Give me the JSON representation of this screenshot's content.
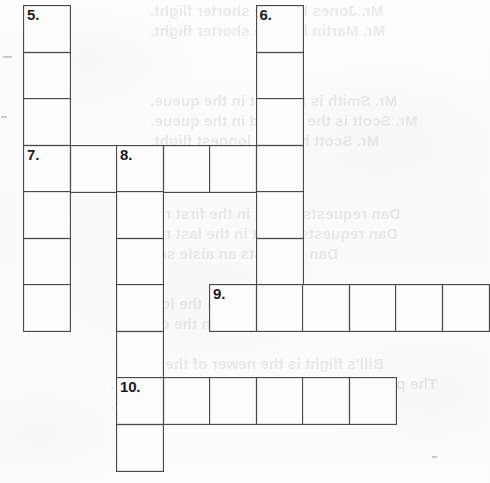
{
  "document": {
    "type": "crossword-puzzle-worksheet",
    "title": "Crossword Puzzle Grid",
    "cell_size": 46.5,
    "ink_color": "#4a4a4a",
    "paper_color": "#fcfcfc",
    "number_color": "#1b1b1b"
  },
  "grid": {
    "columns_x": [
      23,
      69.5,
      116,
      162.5,
      209,
      255.5,
      302,
      348.5,
      395,
      441.5
    ],
    "rows_y": [
      5,
      51.5,
      98,
      144.5,
      191,
      237.5,
      284,
      330.5,
      377,
      423.5
    ],
    "entries": [
      {
        "number": "5.",
        "direction": "down",
        "col": 0,
        "row": 0,
        "length": 4
      },
      {
        "number": "6.",
        "direction": "down",
        "col": 5,
        "row": 0,
        "length": 6
      },
      {
        "number": "7.",
        "direction": "across",
        "col": 0,
        "row": 3,
        "length": 6
      },
      {
        "number": "7b",
        "direction": "down",
        "col": 0,
        "row": 3,
        "length": 4
      },
      {
        "number": "8.",
        "direction": "down",
        "col": 2,
        "row": 3,
        "length": 7
      },
      {
        "number": "9.",
        "direction": "across",
        "col": 4,
        "row": 6,
        "length": 6
      },
      {
        "number": "10.",
        "direction": "across",
        "col": 2,
        "row": 8,
        "length": 6
      }
    ],
    "numbered_cells": [
      {
        "label": "5.",
        "col": 0,
        "row": 0
      },
      {
        "label": "6.",
        "col": 5,
        "row": 0
      },
      {
        "label": "7.",
        "col": 0,
        "row": 3
      },
      {
        "label": "8.",
        "col": 2,
        "row": 3
      },
      {
        "label": "9.",
        "col": 4,
        "row": 6
      },
      {
        "label": "10.",
        "col": 2,
        "row": 8
      }
    ],
    "cells": [
      {
        "col": 0,
        "row": 0,
        "label": "5."
      },
      {
        "col": 0,
        "row": 1,
        "label": ""
      },
      {
        "col": 0,
        "row": 2,
        "label": ""
      },
      {
        "col": 5,
        "row": 0,
        "label": "6."
      },
      {
        "col": 5,
        "row": 1,
        "label": ""
      },
      {
        "col": 5,
        "row": 2,
        "label": ""
      },
      {
        "col": 0,
        "row": 3,
        "label": "7."
      },
      {
        "col": 1,
        "row": 3,
        "label": ""
      },
      {
        "col": 2,
        "row": 3,
        "label": "8."
      },
      {
        "col": 3,
        "row": 3,
        "label": ""
      },
      {
        "col": 4,
        "row": 3,
        "label": ""
      },
      {
        "col": 5,
        "row": 3,
        "label": ""
      },
      {
        "col": 0,
        "row": 4,
        "label": ""
      },
      {
        "col": 2,
        "row": 4,
        "label": ""
      },
      {
        "col": 5,
        "row": 4,
        "label": ""
      },
      {
        "col": 0,
        "row": 5,
        "label": ""
      },
      {
        "col": 2,
        "row": 5,
        "label": ""
      },
      {
        "col": 5,
        "row": 5,
        "label": ""
      },
      {
        "col": 0,
        "row": 6,
        "label": ""
      },
      {
        "col": 2,
        "row": 6,
        "label": ""
      },
      {
        "col": 4,
        "row": 6,
        "label": "9."
      },
      {
        "col": 5,
        "row": 6,
        "label": ""
      },
      {
        "col": 6,
        "row": 6,
        "label": ""
      },
      {
        "col": 7,
        "row": 6,
        "label": ""
      },
      {
        "col": 8,
        "row": 6,
        "label": ""
      },
      {
        "col": 9,
        "row": 6,
        "label": ""
      },
      {
        "col": 2,
        "row": 7,
        "label": ""
      },
      {
        "col": 2,
        "row": 8,
        "label": "10."
      },
      {
        "col": 3,
        "row": 8,
        "label": ""
      },
      {
        "col": 4,
        "row": 8,
        "label": ""
      },
      {
        "col": 5,
        "row": 8,
        "label": ""
      },
      {
        "col": 6,
        "row": 8,
        "label": ""
      },
      {
        "col": 7,
        "row": 8,
        "label": ""
      },
      {
        "col": 2,
        "row": 9,
        "label": ""
      }
    ]
  },
  "bleed_through_text": {
    "note": "faint mirrored text showing through from the reverse side of the sheet",
    "lines": [
      {
        "text": "Mr. Jones has the shorter flight.",
        "x": 150,
        "y": 2,
        "size": 15
      },
      {
        "text": "Mr. Martin has the shorter flight.",
        "x": 150,
        "y": 22,
        "size": 15
      },
      {
        "text": "Mr. Smith is the first in the queue.",
        "x": 150,
        "y": 92,
        "size": 15
      },
      {
        "text": "Mr. Scott is the second in the queue.",
        "x": 150,
        "y": 112,
        "size": 15
      },
      {
        "text": "Mr. Scott has the longest flight.",
        "x": 150,
        "y": 132,
        "size": 15
      },
      {
        "text": "Dan requests a seat in the first row.",
        "x": 140,
        "y": 205,
        "size": 15
      },
      {
        "text": "Dan requests a seat in the last row.",
        "x": 140,
        "y": 225,
        "size": 15
      },
      {
        "text": "Dan requests an aisle seat.",
        "x": 140,
        "y": 245,
        "size": 15
      },
      {
        "text": "The passengers have to wait in the lounge.",
        "x": 120,
        "y": 295,
        "size": 15
      },
      {
        "text": "The passengers have to wait in the queue.",
        "x": 120,
        "y": 315,
        "size": 15
      },
      {
        "text": "Bill's flight is the newer of the two.",
        "x": 130,
        "y": 355,
        "size": 15
      },
      {
        "text": "The passengers have to check in at the gate.",
        "x": 110,
        "y": 375,
        "size": 15
      },
      {
        "text": "They have to board a bus to the plane.",
        "x": 110,
        "y": 395,
        "size": 15
      }
    ]
  },
  "scan_marks": [
    {
      "x": 3,
      "y": 56,
      "w": 9,
      "h": 2
    },
    {
      "x": 1,
      "y": 116,
      "w": 6,
      "h": 2
    },
    {
      "x": 432,
      "y": 456,
      "w": 5,
      "h": 2
    }
  ]
}
